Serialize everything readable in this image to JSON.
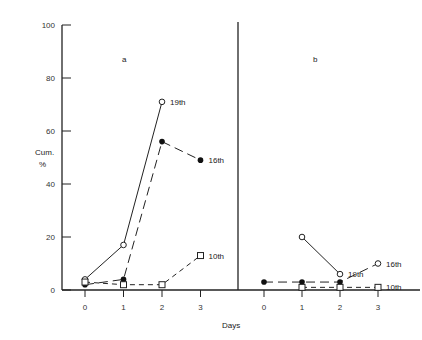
{
  "chart_data": {
    "type": "line",
    "title": "",
    "xlabel": "Days",
    "ylabel": "Cum. %",
    "ylim": [
      0,
      100
    ],
    "yticks": [
      0,
      20,
      40,
      60,
      80,
      100
    ],
    "grid": false,
    "legend": "inline labels at line ends",
    "panels": [
      {
        "label": "a",
        "x": [
          0,
          1,
          2,
          3
        ],
        "series": [
          {
            "name": "19th",
            "marker": "open-circle",
            "line": "solid",
            "points": [
              [
                0,
                4
              ],
              [
                1,
                17
              ],
              [
                2,
                71
              ]
            ]
          },
          {
            "name": "16th",
            "marker": "filled-circle",
            "line": "long-dash",
            "points": [
              [
                0,
                2
              ],
              [
                1,
                4
              ],
              [
                2,
                56
              ],
              [
                3,
                49
              ]
            ]
          },
          {
            "name": "10th",
            "marker": "open-square",
            "line": "short-dash",
            "points": [
              [
                0,
                3
              ],
              [
                1,
                2
              ],
              [
                2,
                2
              ],
              [
                3,
                13
              ]
            ]
          }
        ]
      },
      {
        "label": "b",
        "x": [
          0,
          1,
          2,
          3
        ],
        "series": [
          {
            "name": "19th",
            "marker": "open-circle",
            "line": "solid",
            "points": [
              [
                1,
                20
              ],
              [
                2,
                6
              ]
            ]
          },
          {
            "name": "16th",
            "marker": "filled-circle",
            "line": "long-dash",
            "points": [
              [
                0,
                3
              ],
              [
                1,
                3
              ],
              [
                2,
                3
              ],
              [
                3,
                10
              ]
            ]
          },
          {
            "name": "10th",
            "marker": "open-square",
            "line": "short-dash",
            "points": [
              [
                1,
                1
              ],
              [
                2,
                1
              ],
              [
                3,
                1
              ]
            ]
          }
        ]
      }
    ]
  },
  "labels": {
    "ylabel_line1": "Cum.",
    "ylabel_line2": "%",
    "xlabel": "Days",
    "panel_a": "a",
    "panel_b": "b"
  }
}
